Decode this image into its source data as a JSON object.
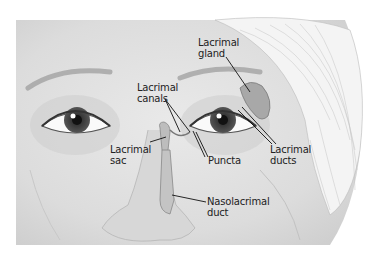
{
  "figure": {
    "labels": {
      "lacrimal_gland": [
        "Lacrimal",
        "gland"
      ],
      "lacrimal_canals": [
        "Lacrimal",
        "canals"
      ],
      "lacrimal_sac": [
        "Lacrimal",
        "sac"
      ],
      "puncta": [
        "Puncta"
      ],
      "lacrimal_ducts": [
        "Lacrimal",
        "ducts"
      ],
      "nasolacrimal_duct": [
        "Nasolacrimal",
        "duct"
      ]
    }
  }
}
